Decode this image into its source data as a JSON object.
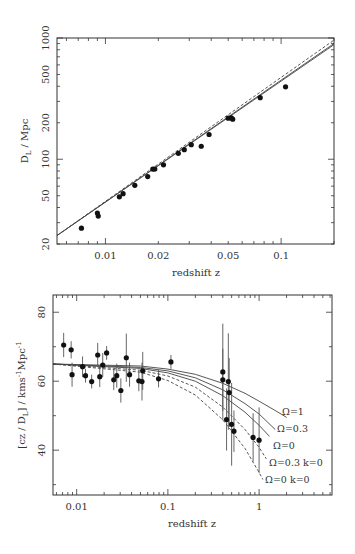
{
  "chart_data": [
    {
      "type": "scatter",
      "title": "",
      "xlabel": "redshift z",
      "ylabel": "D_L / Mpc",
      "xscale": "log",
      "yscale": "log",
      "xlim": [
        0.0053,
        0.2
      ],
      "ylim": [
        20,
        1000
      ],
      "grid": false,
      "xticks": [
        0.01,
        0.02,
        0.05,
        0.1
      ],
      "xtick_labels": [
        "0.01",
        "0.02",
        "0.05",
        "0.1"
      ],
      "yticks": [
        20,
        50,
        100,
        200,
        500,
        1000
      ],
      "ytick_labels": [
        "20",
        "50",
        "100",
        "200",
        "500",
        "1000"
      ],
      "series": [
        {
          "name": "data",
          "kind": "points",
          "x": [
            0.0073,
            0.009,
            0.0091,
            0.012,
            0.0126,
            0.0147,
            0.0174,
            0.0186,
            0.0191,
            0.0214,
            0.026,
            0.0281,
            0.0308,
            0.0351,
            0.0389,
            0.05,
            0.052,
            0.053,
            0.076,
            0.106
          ],
          "y": [
            27,
            36,
            34,
            49,
            52,
            61,
            72,
            83,
            83,
            90,
            112,
            120,
            132,
            128,
            160,
            218,
            219,
            214,
            322,
            396
          ]
        },
        {
          "name": "model solid 1",
          "kind": "line",
          "style": "solid",
          "x": [
            0.0053,
            0.2
          ],
          "y": [
            23.5,
            880
          ]
        },
        {
          "name": "model solid 2",
          "kind": "line",
          "style": "solid",
          "x": [
            0.0053,
            0.2
          ],
          "y": [
            23.5,
            900
          ]
        },
        {
          "name": "model dashed",
          "kind": "line",
          "style": "dashed",
          "x": [
            0.0053,
            0.2
          ],
          "y": [
            23.5,
            960
          ]
        }
      ]
    },
    {
      "type": "scatter",
      "title": "",
      "xlabel": "redshift z",
      "ylabel": "[cz / D_L] / kms^-1 Mpc^-1",
      "xscale": "log",
      "yscale": "linear",
      "xlim": [
        0.0055,
        6.3
      ],
      "ylim": [
        27,
        85
      ],
      "grid": false,
      "xticks": [
        0.01,
        0.1,
        1
      ],
      "xtick_labels": [
        "0.01",
        "0.1",
        "1"
      ],
      "yticks": [
        40,
        60,
        80
      ],
      "ytick_labels": [
        "40",
        "60",
        "80"
      ],
      "series": [
        {
          "name": "data",
          "kind": "points",
          "x": [
            0.0072,
            0.0087,
            0.0089,
            0.0116,
            0.0125,
            0.0146,
            0.017,
            0.0179,
            0.0193,
            0.0213,
            0.0255,
            0.0275,
            0.0305,
            0.035,
            0.038,
            0.048,
            0.052,
            0.053,
            0.079,
            0.108,
            0.4,
            0.4,
            0.46,
            0.47,
            0.44,
            0.5,
            0.53,
            0.86,
            1.0
          ],
          "y": [
            70.5,
            69.1,
            61.9,
            64.2,
            61.6,
            59.9,
            67.6,
            61.3,
            64.7,
            68.2,
            60.4,
            61.6,
            57.3,
            66.8,
            61.9,
            60.1,
            59.9,
            63.0,
            60.7,
            65.6,
            62.7,
            60.4,
            59.9,
            56.7,
            48.9,
            47.5,
            45.5,
            43.7,
            42.9
          ],
          "yerr": [
            3.5,
            2.5,
            3.5,
            3.0,
            2.0,
            2.0,
            3.5,
            3.0,
            3.5,
            2.0,
            3.0,
            3.5,
            3.5,
            7.0,
            3.5,
            3.0,
            5.5,
            5.5,
            2.5,
            2.0,
            14.0,
            9.0,
            14.0,
            10.0,
            9.0,
            12.0,
            6.0,
            7.0,
            9.5
          ]
        },
        {
          "name": "Ω=1",
          "kind": "line",
          "style": "solid",
          "x": [
            0.0055,
            0.05,
            0.1,
            0.2,
            0.4,
            0.7,
            1.0,
            1.5,
            2.0
          ],
          "y": [
            65.0,
            64.4,
            63.5,
            62.0,
            59.4,
            56.5,
            54.2,
            51.5,
            49.5
          ]
        },
        {
          "name": "Ω=0.3",
          "kind": "line",
          "style": "solid",
          "x": [
            0.0055,
            0.05,
            0.1,
            0.2,
            0.4,
            0.7,
            1.0,
            1.5
          ],
          "y": [
            65.0,
            64.0,
            63.0,
            61.0,
            57.5,
            53.5,
            50.5,
            46.0
          ]
        },
        {
          "name": "Ω=0",
          "kind": "line",
          "style": "solid",
          "x": [
            0.0055,
            0.05,
            0.1,
            0.2,
            0.4,
            0.7,
            1.0,
            1.3
          ],
          "y": [
            65.0,
            63.7,
            62.4,
            60.0,
            55.8,
            51.0,
            47.2,
            44.0
          ]
        },
        {
          "name": "Ω=0.3 k=0",
          "kind": "line",
          "style": "dashed",
          "x": [
            0.0055,
            0.05,
            0.1,
            0.2,
            0.4,
            0.7,
            1.0,
            1.2
          ],
          "y": [
            65.0,
            63.2,
            61.5,
            58.3,
            52.5,
            46.0,
            40.8,
            37.5
          ]
        },
        {
          "name": "Ω=0 k=0",
          "kind": "line",
          "style": "dashed",
          "x": [
            0.0055,
            0.05,
            0.1,
            0.2,
            0.4,
            0.7,
            1.0,
            1.1
          ],
          "y": [
            65.0,
            62.6,
            60.2,
            56.0,
            48.8,
            40.5,
            33.5,
            31.5
          ]
        }
      ],
      "annotations": [
        {
          "text": "Ω=1",
          "x_px": 282,
          "y_px": 415
        },
        {
          "text": "Ω=0.3",
          "x_px": 277,
          "y_px": 432
        },
        {
          "text": "Ω=0",
          "x_px": 273,
          "y_px": 449
        },
        {
          "text": "Ω=0.3 k=0",
          "x_px": 269,
          "y_px": 466
        },
        {
          "text": "Ω=0 k=0",
          "x_px": 265,
          "y_px": 483
        }
      ]
    }
  ]
}
